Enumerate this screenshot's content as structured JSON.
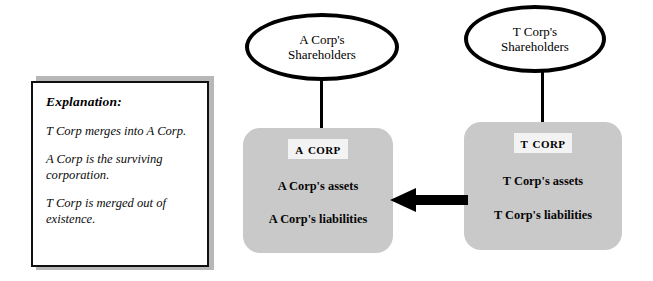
{
  "explanation": {
    "title": "Explanation:",
    "paragraphs": [
      "T Corp merges into A Corp.",
      "A Corp is the surviving corporation.",
      "T Corp is merged out of existence."
    ]
  },
  "shareholders": {
    "acquirer": {
      "line1": "A Corp's",
      "line2": "Shareholders"
    },
    "target": {
      "line1": "T Corp's",
      "line2": "Shareholders"
    }
  },
  "entities": {
    "acquirer": {
      "title": "A Corp",
      "assets": "A Corp's assets",
      "liabilities": "A Corp's liabilities"
    },
    "target": {
      "title": "T Corp",
      "assets": "T Corp's assets",
      "liabilities": "T Corp's liabilities"
    }
  },
  "arrow": {
    "direction": "left",
    "meaning": "T Corp merges into A Corp"
  },
  "colors": {
    "box_fill": "#c9c9c9",
    "outline": "#000000",
    "title_label_fill": "#f3f3f3",
    "panel_shadow": "#b7b7b7"
  }
}
